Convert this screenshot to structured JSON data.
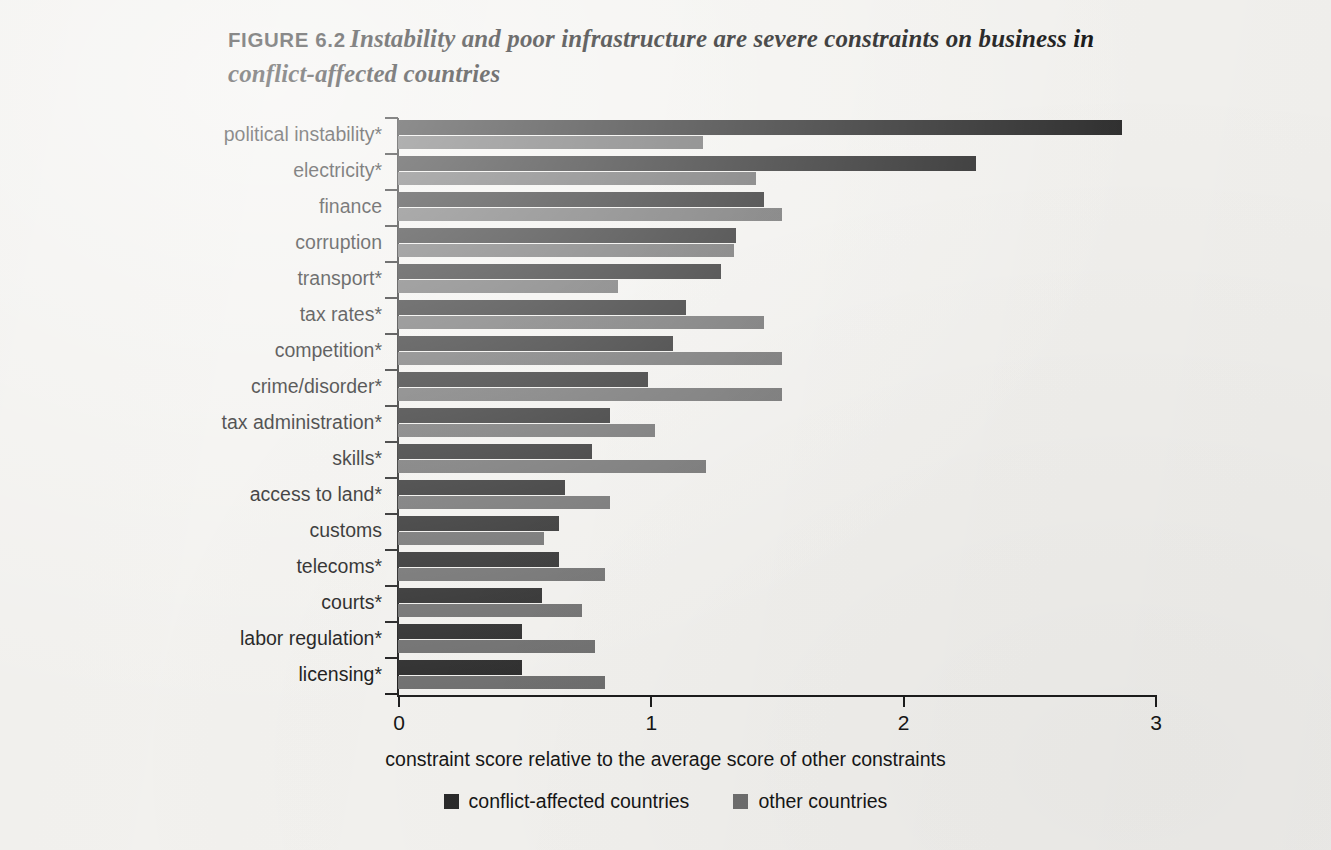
{
  "figure": {
    "label": "FIGURE 6.2",
    "caption": "Instability and poor infrastructure are severe constraints on business in conflict-affected countries"
  },
  "legend": {
    "items": [
      {
        "label": "conflict-affected countries",
        "color": "#2b2b2b"
      },
      {
        "label": "other countries",
        "color": "#6e6e6e"
      }
    ]
  },
  "axis": {
    "x_caption": "constraint score relative to the average score of other constraints",
    "x_ticks": [
      "0",
      "1",
      "2",
      "3"
    ]
  },
  "chart_data": {
    "type": "bar",
    "orientation": "horizontal",
    "title": "Instability and poor infrastructure are severe constraints on business in conflict-affected countries",
    "xlabel": "constraint score relative to the average score of other constraints",
    "ylabel": "",
    "xlim": [
      0,
      3
    ],
    "xticks": [
      0,
      1,
      2,
      3
    ],
    "grid": false,
    "legend_position": "bottom",
    "categories": [
      "political instability*",
      "electricity*",
      "finance",
      "corruption",
      "transport*",
      "tax rates*",
      "competition*",
      "crime/disorder*",
      "tax administration*",
      "skills*",
      "access to land*",
      "customs",
      "telecoms*",
      "courts*",
      "labor regulation*",
      "licensing*"
    ],
    "series": [
      {
        "name": "conflict-affected countries",
        "color": "#2b2b2b",
        "values": [
          2.87,
          2.29,
          1.45,
          1.34,
          1.28,
          1.14,
          1.09,
          0.99,
          0.84,
          0.77,
          0.66,
          0.64,
          0.64,
          0.57,
          0.49,
          0.49
        ]
      },
      {
        "name": "other countries",
        "color": "#6e6e6e",
        "values": [
          1.21,
          1.42,
          1.52,
          1.33,
          0.87,
          1.45,
          1.52,
          1.52,
          1.02,
          1.22,
          0.84,
          0.58,
          0.82,
          0.73,
          0.78,
          0.82
        ]
      }
    ]
  }
}
